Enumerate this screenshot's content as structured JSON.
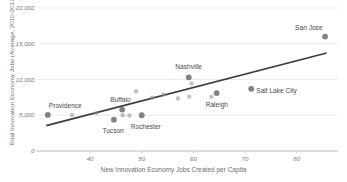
{
  "chart_data": {
    "type": "scatter",
    "title": "",
    "xlabel": "New Innovation Economy Jobs Created per Capita",
    "ylabel": "Total Innovation Economy Jobs (Average, 2010-2017)",
    "xlim": [
      30,
      88
    ],
    "ylim": [
      0,
      20000
    ],
    "xticks": [
      40,
      50,
      60,
      70,
      80
    ],
    "xtick_labels": [
      "40",
      "50",
      "60",
      "70",
      "80"
    ],
    "yticks": [
      0,
      5000,
      10000,
      15000,
      20000
    ],
    "ytick_labels": [
      "0",
      "5,000",
      "10,000",
      "15,000",
      "20,000"
    ],
    "grid": "horizontal",
    "legend": "none",
    "point_color": "#8f8f8f",
    "labeled_point_color": "#7b7b7b",
    "trendline_color": "#3b3b3b",
    "axis_color": "#b4b4b4",
    "grid_color": "#e2e2e2",
    "trendline": {
      "x_start": 31.5,
      "y_start": 3550,
      "x_end": 85.8,
      "y_end": 13700
    },
    "points": [
      {
        "label": "Providence",
        "x": 31.8,
        "y": 5050,
        "label_dx": 1,
        "label_dy": -9,
        "label_anchor": "start"
      },
      {
        "label": "",
        "x": 36.5,
        "y": 5050
      },
      {
        "label": "",
        "x": 41.2,
        "y": 5300
      },
      {
        "label": "Tucson",
        "x": 44.6,
        "y": 4380,
        "label_dx": -1,
        "label_dy": 11,
        "label_anchor": "middle"
      },
      {
        "label": "Buffalo",
        "x": 46.2,
        "y": 5800,
        "label_dx": -2,
        "label_dy": -10,
        "label_anchor": "middle"
      },
      {
        "label": "",
        "x": 46.3,
        "y": 5000
      },
      {
        "label": "",
        "x": 47.6,
        "y": 4960
      },
      {
        "label": "Rochester",
        "x": 50.0,
        "y": 5000,
        "label_dx": 4,
        "label_dy": 12,
        "label_anchor": "middle"
      },
      {
        "label": "",
        "x": 48.9,
        "y": 8350
      },
      {
        "label": "",
        "x": 52.0,
        "y": 7450
      },
      {
        "label": "",
        "x": 54.2,
        "y": 7900
      },
      {
        "label": "",
        "x": 57.0,
        "y": 7350
      },
      {
        "label": "Nashville",
        "x": 59.1,
        "y": 10300,
        "label_dx": 0,
        "label_dy": -10,
        "label_anchor": "middle"
      },
      {
        "label": "",
        "x": 59.6,
        "y": 9450
      },
      {
        "label": "",
        "x": 59.2,
        "y": 7600
      },
      {
        "label": "Raleigh",
        "x": 64.5,
        "y": 8100,
        "label_dx": 0,
        "label_dy": 12,
        "label_anchor": "middle"
      },
      {
        "label": "",
        "x": 63.5,
        "y": 7600
      },
      {
        "label": "Salt Lake City",
        "x": 71.2,
        "y": 8700,
        "label_dx": 5,
        "label_dy": 2,
        "label_anchor": "start"
      },
      {
        "label": "San Jose",
        "x": 85.5,
        "y": 16000,
        "label_dx": -2,
        "label_dy": -9,
        "label_anchor": "end"
      }
    ]
  }
}
